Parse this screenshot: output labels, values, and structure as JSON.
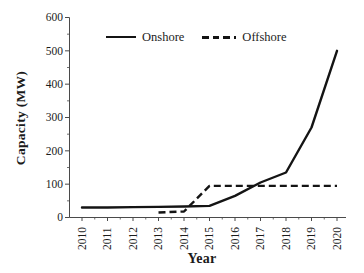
{
  "figure": {
    "background": "#ffffff",
    "line_color": "#141414",
    "axis_color": "#4a4a4a",
    "text_color": "#1c1c1c"
  },
  "chart_data": {
    "type": "line",
    "title": "",
    "xlabel": "Year",
    "ylabel": "Capacity (MW)",
    "x": [
      "2010",
      "2011",
      "2012",
      "2013",
      "2014",
      "2015",
      "2016",
      "2017",
      "2018",
      "2019",
      "2020"
    ],
    "series": [
      {
        "name": "Onshore",
        "style": "solid",
        "values": [
          30,
          30,
          31,
          32,
          33,
          35,
          65,
          105,
          135,
          270,
          500
        ]
      },
      {
        "name": "Offshore",
        "style": "dashed",
        "values": [
          null,
          null,
          null,
          15,
          18,
          95,
          95,
          95,
          95,
          95,
          95
        ]
      }
    ],
    "ylim": [
      0,
      600
    ],
    "yticks": [
      0,
      100,
      200,
      300,
      400,
      500,
      600
    ],
    "grid": false,
    "legend_position": "top-inside"
  }
}
